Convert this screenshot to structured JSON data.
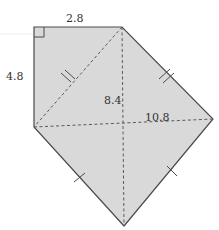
{
  "figure": {
    "type": "geometry-diagram",
    "colors": {
      "fill": "#d9d9d9",
      "edge": "#4a4a4a",
      "dashed": "#5a5a5a",
      "label": "#333333"
    },
    "vertices": {
      "top_left": [
        34,
        27
      ],
      "top_right": [
        122,
        27
      ],
      "right": [
        213,
        119
      ],
      "bottom": [
        124,
        226
      ],
      "left": [
        34,
        127
      ]
    },
    "labels": {
      "top_edge": "2.8",
      "left_edge": "4.8",
      "vertical_dashed": "8.4",
      "horizontal_dashed": "10.8"
    },
    "marks": {
      "right_angle": "top-left corner",
      "double_tick": [
        "diagonal top_right–left",
        "edge top_right–right"
      ],
      "single_tick": [
        "edge left–bottom",
        "edge right–bottom"
      ]
    }
  }
}
